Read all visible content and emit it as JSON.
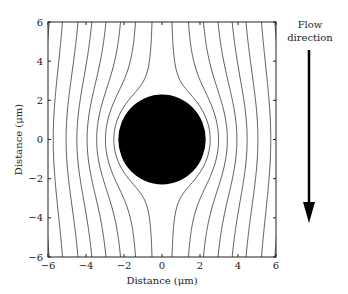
{
  "chart_data": {
    "type": "line",
    "title": "",
    "xlabel": "Distance (μm)",
    "ylabel": "Distance (μm)",
    "xlim": [
      -6,
      6
    ],
    "ylim": [
      -6,
      6
    ],
    "xticks": [
      -6,
      -4,
      -2,
      0,
      2,
      4,
      6
    ],
    "yticks": [
      -6,
      -4,
      -2,
      0,
      2,
      4,
      6
    ],
    "grid": false,
    "obstacle": {
      "shape": "circle",
      "center": [
        0,
        0
      ],
      "radius": 2.3,
      "fill": "#000000"
    },
    "streamline_far_field_x": [
      -5.5,
      -4.8,
      -4.0,
      -3.3,
      -2.6,
      -1.9,
      -1.2,
      -0.45,
      0.45,
      1.2,
      1.9,
      2.6,
      3.3,
      4.0,
      4.8,
      5.5
    ],
    "annotation": {
      "text_line1": "Flow",
      "text_line2": "direction",
      "arrow": "down"
    }
  },
  "colors": {
    "line": "#333333",
    "obstacle": "#000000",
    "background": "#ffffff"
  }
}
